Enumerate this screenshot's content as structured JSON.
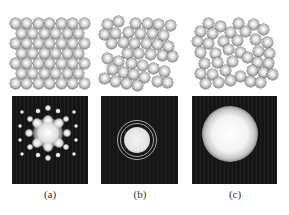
{
  "figure": {
    "panels": [
      {
        "id": "a",
        "label": "(a)",
        "structure": "crystalline",
        "label_x": 50,
        "pattern": {
          "left": 12,
          "width": 76,
          "type": "spots",
          "center": [
            48,
            133
          ],
          "spots": [
            [
              48,
              133,
              15
            ],
            [
              37,
              123,
              5
            ],
            [
              59,
              123,
              5
            ],
            [
              37,
              143,
              5
            ],
            [
              59,
              143,
              5
            ],
            [
              48,
              120,
              5
            ],
            [
              48,
              147,
              5
            ],
            [
              29,
              133,
              4
            ],
            [
              67,
              133,
              4
            ],
            [
              30,
              119,
              3
            ],
            [
              66,
              119,
              3
            ],
            [
              30,
              147,
              3
            ],
            [
              66,
              147,
              3
            ],
            [
              48,
              108,
              3
            ],
            [
              48,
              158,
              3
            ],
            [
              38,
              111,
              2.5
            ],
            [
              58,
              111,
              2.5
            ],
            [
              38,
              155,
              2.5
            ],
            [
              58,
              155,
              2.5
            ],
            [
              20,
              126,
              2
            ],
            [
              76,
              126,
              2
            ],
            [
              20,
              140,
              2
            ],
            [
              76,
              140,
              2
            ],
            [
              22,
              112,
              2
            ],
            [
              74,
              112,
              2
            ],
            [
              22,
              154,
              2
            ],
            [
              74,
              154,
              2
            ]
          ]
        }
      },
      {
        "id": "b",
        "label": "(b)",
        "structure": "polycrystalline",
        "label_x": 140,
        "pattern": {
          "left": 101,
          "width": 77,
          "type": "rings",
          "center": [
            137,
            140
          ],
          "core_radius": 13,
          "rings": [
            17,
            20
          ]
        }
      },
      {
        "id": "c",
        "label": "(c)",
        "structure": "amorphous",
        "label_x": 235,
        "pattern": {
          "left": 192,
          "width": 85,
          "type": "diffuse",
          "center": [
            230,
            134
          ],
          "core_radius": 17,
          "halo_radius": 28
        }
      }
    ],
    "lattices": {
      "a": [
        [
          15,
          23
        ],
        [
          26.5,
          23
        ],
        [
          38,
          23
        ],
        [
          49.5,
          23
        ],
        [
          61,
          23
        ],
        [
          72.5,
          23
        ],
        [
          84,
          23
        ],
        [
          21,
          33
        ],
        [
          32.5,
          33
        ],
        [
          44,
          33
        ],
        [
          55.5,
          33
        ],
        [
          67,
          33
        ],
        [
          78.5,
          33
        ],
        [
          15,
          43
        ],
        [
          26.5,
          43
        ],
        [
          38,
          43
        ],
        [
          49.5,
          43
        ],
        [
          61,
          43
        ],
        [
          72.5,
          43
        ],
        [
          84,
          43
        ],
        [
          21,
          53
        ],
        [
          32.5,
          53
        ],
        [
          44,
          53
        ],
        [
          55.5,
          53
        ],
        [
          67,
          53
        ],
        [
          78.5,
          53
        ],
        [
          15,
          63
        ],
        [
          26.5,
          63
        ],
        [
          38,
          63
        ],
        [
          49.5,
          63
        ],
        [
          61,
          63
        ],
        [
          72.5,
          63
        ],
        [
          84,
          63
        ],
        [
          21,
          73
        ],
        [
          32.5,
          73
        ],
        [
          44,
          73
        ],
        [
          55.5,
          73
        ],
        [
          67,
          73
        ],
        [
          78.5,
          73
        ],
        [
          15,
          83
        ],
        [
          26.5,
          83
        ],
        [
          38,
          83
        ],
        [
          49.5,
          83
        ],
        [
          61,
          83
        ],
        [
          72.5,
          83
        ],
        [
          84,
          83
        ]
      ],
      "b": [
        [
          107,
          24
        ],
        [
          118,
          21
        ],
        [
          135,
          23
        ],
        [
          147,
          23
        ],
        [
          158,
          24
        ],
        [
          170,
          25
        ],
        [
          104,
          34
        ],
        [
          115,
          33
        ],
        [
          128,
          32
        ],
        [
          140,
          33
        ],
        [
          152,
          33
        ],
        [
          163,
          35
        ],
        [
          111,
          43
        ],
        [
          123,
          42
        ],
        [
          134,
          43
        ],
        [
          146,
          43
        ],
        [
          157,
          44
        ],
        [
          168,
          46
        ],
        [
          127,
          53
        ],
        [
          138,
          53
        ],
        [
          150,
          54
        ],
        [
          162,
          55
        ],
        [
          172,
          56
        ],
        [
          107,
          58
        ],
        [
          118,
          61
        ],
        [
          131,
          63
        ],
        [
          142,
          65
        ],
        [
          153,
          68
        ],
        [
          164,
          71
        ],
        [
          112,
          69
        ],
        [
          123,
          72
        ],
        [
          133,
          74
        ],
        [
          144,
          77
        ],
        [
          104,
          78
        ],
        [
          115,
          81
        ],
        [
          126,
          83
        ],
        [
          137,
          85
        ],
        [
          157,
          81
        ],
        [
          167,
          82
        ]
      ],
      "c": [
        [
          208,
          23
        ],
        [
          220,
          26
        ],
        [
          238,
          23
        ],
        [
          253,
          24
        ],
        [
          200,
          31
        ],
        [
          212,
          33
        ],
        [
          230,
          32
        ],
        [
          245,
          31
        ],
        [
          263,
          29
        ],
        [
          197,
          41
        ],
        [
          208,
          43
        ],
        [
          223,
          41
        ],
        [
          237,
          40
        ],
        [
          255,
          39
        ],
        [
          267,
          42
        ],
        [
          200,
          52
        ],
        [
          215,
          53
        ],
        [
          228,
          49
        ],
        [
          240,
          52
        ],
        [
          258,
          51
        ],
        [
          269,
          53
        ],
        [
          204,
          63
        ],
        [
          217,
          62
        ],
        [
          232,
          61
        ],
        [
          247,
          57
        ],
        [
          257,
          62
        ],
        [
          268,
          63
        ],
        [
          200,
          73
        ],
        [
          212,
          74
        ],
        [
          225,
          70
        ],
        [
          240,
          76
        ],
        [
          252,
          70
        ],
        [
          263,
          72
        ],
        [
          272,
          74
        ],
        [
          205,
          83
        ],
        [
          218,
          82
        ],
        [
          230,
          80
        ],
        [
          250,
          81
        ],
        [
          260,
          82
        ]
      ]
    },
    "sphere_diameter": 11,
    "colors": {
      "background": "#ffffff",
      "pattern_bg": "#161616",
      "label": "#333333"
    }
  }
}
